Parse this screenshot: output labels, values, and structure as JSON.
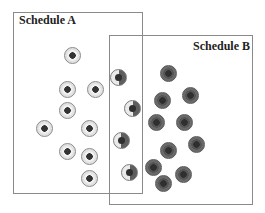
{
  "diagram": {
    "sets": [
      {
        "id": "A",
        "label": "Schedule A",
        "box": {
          "left": 13,
          "top": 12,
          "width": 130,
          "height": 182
        },
        "label_pos": {
          "left": 19,
          "top": 13
        }
      },
      {
        "id": "B",
        "label": "Schedule B",
        "box": {
          "left": 109,
          "top": 35,
          "width": 144,
          "height": 170
        },
        "label_pos": {
          "left": 193,
          "top": 39
        }
      }
    ],
    "nodes": [
      {
        "type": "light",
        "x": 72,
        "y": 55
      },
      {
        "type": "light",
        "x": 67,
        "y": 89
      },
      {
        "type": "light",
        "x": 95,
        "y": 89
      },
      {
        "type": "light",
        "x": 67,
        "y": 110
      },
      {
        "type": "light",
        "x": 44,
        "y": 128
      },
      {
        "type": "light",
        "x": 89,
        "y": 128
      },
      {
        "type": "light",
        "x": 67,
        "y": 151
      },
      {
        "type": "light",
        "x": 89,
        "y": 156
      },
      {
        "type": "light",
        "x": 89,
        "y": 178
      },
      {
        "type": "split",
        "x": 118,
        "y": 77
      },
      {
        "type": "split",
        "x": 132,
        "y": 108
      },
      {
        "type": "split",
        "x": 121,
        "y": 140
      },
      {
        "type": "split",
        "x": 129,
        "y": 172
      },
      {
        "type": "dark",
        "x": 168,
        "y": 73
      },
      {
        "type": "dark",
        "x": 162,
        "y": 100
      },
      {
        "type": "dark",
        "x": 190,
        "y": 95
      },
      {
        "type": "dark",
        "x": 156,
        "y": 122
      },
      {
        "type": "dark",
        "x": 184,
        "y": 122
      },
      {
        "type": "dark",
        "x": 168,
        "y": 150
      },
      {
        "type": "dark",
        "x": 196,
        "y": 144
      },
      {
        "type": "dark",
        "x": 153,
        "y": 167
      },
      {
        "type": "dark",
        "x": 183,
        "y": 174
      },
      {
        "type": "dark",
        "x": 163,
        "y": 183
      }
    ],
    "colors": {
      "light_fill": "#e2e2e2",
      "dark_fill": "#6a6a6a",
      "center_dot": "#2f2f2f",
      "border": "#8a8a8a"
    }
  }
}
